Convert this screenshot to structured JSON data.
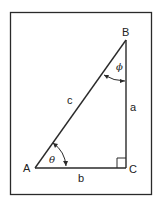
{
  "diagram": {
    "type": "right-triangle",
    "vertices": {
      "A": "A",
      "B": "B",
      "C": "C"
    },
    "sides": {
      "opposite_A": "a",
      "opposite_C": "c",
      "opposite_B": "b"
    },
    "angles": {
      "at_A": "θ",
      "at_B": "ϕ"
    },
    "right_angle_at": "C",
    "colors": {
      "stroke": "#2a2a2a",
      "background": "#ffffff"
    }
  }
}
